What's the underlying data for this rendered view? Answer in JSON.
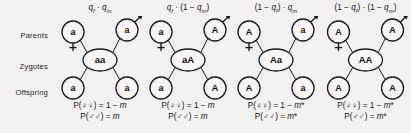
{
  "figure": {
    "background_color": "#f2f1ef",
    "line_color": "#1a1a1a",
    "row_labels": [
      {
        "key": "parents",
        "label": "Parents"
      },
      {
        "key": "zygotes",
        "label": "Zygotes"
      },
      {
        "key": "offspring",
        "label": "Offspring"
      }
    ],
    "symbols": {
      "female": "♀",
      "male": "♂",
      "female_name": "female-symbol",
      "male_name": "male-symbol"
    },
    "columns": [
      {
        "id": "col-1",
        "header_html": "<span class=\"it\">q</span><sub class=\"it\">f</sub> · <span class=\"it\">q</span><sub class=\"it\">m</sub>",
        "header_text": "qf · qm",
        "parent_female_allele": "a",
        "parent_male_allele": "a",
        "zygote": "aa",
        "offspring_left_allele": "a",
        "offspring_right_allele": "a",
        "prob_female_html": "P(♀♀) = 1 − <span class=\"it\">m</span>",
        "prob_female_text": "P(♀♀) = 1 − m",
        "prob_male_html": "P(♂♂) = <span class=\"it\">m</span>",
        "prob_male_text": "P(♂♂) = m"
      },
      {
        "id": "col-2",
        "header_html": "<span class=\"it\">q</span><sub class=\"it\">f</sub> · (1 − <span class=\"it\">q</span><sub class=\"it\">m</sub>)",
        "header_text": "qf · (1 − qm)",
        "parent_female_allele": "a",
        "parent_male_allele": "A",
        "zygote": "aA",
        "offspring_left_allele": "a",
        "offspring_right_allele": "A",
        "prob_female_html": "P(♀♀) = 1 − <span class=\"it\">m</span>",
        "prob_female_text": "P(♀♀) = 1 − m",
        "prob_male_html": "P(♂♂) = <span class=\"it\">m</span>",
        "prob_male_text": "P(♂♂) = m"
      },
      {
        "id": "col-3",
        "header_html": "(1 − <span class=\"it\">q</span><sub class=\"it\">f</sub>) · <span class=\"it\">q</span><sub class=\"it\">m</sub>",
        "header_text": "(1 − qf) · qm",
        "parent_female_allele": "A",
        "parent_male_allele": "a",
        "zygote": "Aa",
        "offspring_left_allele": "A",
        "offspring_right_allele": "a",
        "prob_female_html": "P(♀♀) = 1 − <span class=\"it\">m</span>*",
        "prob_female_text": "P(♀♀) = 1 − m*",
        "prob_male_html": "P(♂♂) = <span class=\"it\">m</span>*",
        "prob_male_text": "P(♂♂) = m*"
      },
      {
        "id": "col-4",
        "header_html": "(1 − <span class=\"it\">q</span><sub class=\"it\">f</sub>) · (1 − <span class=\"it\">q</span><sub class=\"it\">m</sub>)",
        "header_text": "(1 − qf) · (1 − qm)",
        "parent_female_allele": "A",
        "parent_male_allele": "A",
        "zygote": "AA",
        "offspring_left_allele": "A",
        "offspring_right_allele": "A",
        "prob_female_html": "P(♀♀) = 1 − <span class=\"it\">m</span>*",
        "prob_female_text": "P(♀♀) = 1 − m*",
        "prob_male_html": "P(♂♂) = <span class=\"it\">m</span>*",
        "prob_male_text": "P(♂♂) = m*"
      }
    ]
  }
}
